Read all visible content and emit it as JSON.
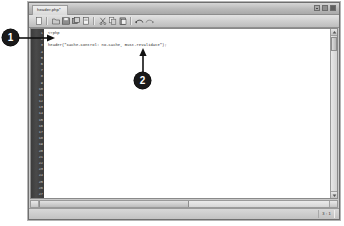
{
  "window": {
    "tab_title": "header.php*",
    "buttons": {
      "minimize": "minimize",
      "maximize": "maximize",
      "close": "close"
    }
  },
  "toolbar": {
    "icons": [
      "new-file-icon",
      "open-folder-icon",
      "save-icon",
      "save-all-icon",
      "print-icon",
      "cut-icon",
      "copy-icon",
      "paste-icon",
      "undo-icon",
      "redo-icon"
    ]
  },
  "editor": {
    "line_numbers": [
      "1",
      "2",
      "3",
      "4",
      "5",
      "6",
      "7",
      "8",
      "9",
      "10",
      "11",
      "12",
      "13",
      "14",
      "15",
      "16",
      "17",
      "18",
      "19",
      "20",
      "21",
      "22",
      "23",
      "24",
      "25",
      "26",
      "27"
    ],
    "code_lines": [
      "<?php",
      "",
      "header(\"Cache-Control: no-cache, must-revalidate\");",
      "",
      "",
      "",
      "",
      "",
      "",
      "",
      "",
      "",
      "",
      "",
      "",
      "",
      "",
      "",
      "",
      "",
      "",
      "",
      "",
      "",
      "",
      "",
      ""
    ]
  },
  "statusbar": {
    "cursor_position": "3 : 1"
  },
  "callouts": [
    {
      "number": "1"
    },
    {
      "number": "2"
    }
  ],
  "colors": {
    "gutter_bg": "#3f3f3f",
    "gutter_text": "#cfcfcf",
    "code_text": "#1d1d1d",
    "window_chrome": "#c9c9c9",
    "callout_bg": "#1a1a1a"
  }
}
